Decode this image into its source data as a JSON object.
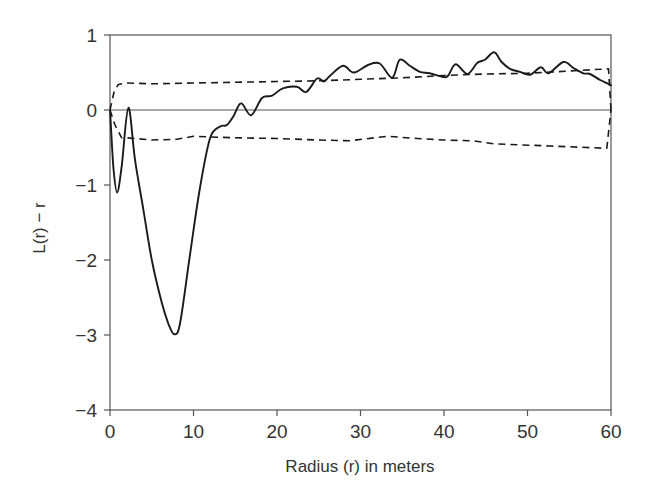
{
  "chart_data": {
    "type": "line",
    "title": "",
    "xlabel": "Radius (r) in meters",
    "ylabel": "L(r) − r",
    "xlim": [
      0,
      60
    ],
    "ylim": [
      -4,
      1
    ],
    "xticks": [
      0,
      10,
      20,
      30,
      40,
      50,
      60
    ],
    "yticks": [
      1,
      0,
      -1,
      -2,
      -3,
      -4
    ],
    "xtick_labels": [
      "0",
      "10",
      "20",
      "30",
      "40",
      "50",
      "60"
    ],
    "ytick_labels": [
      "1",
      "0",
      "−1",
      "−2",
      "−3",
      "−4"
    ],
    "grid": false,
    "legend": null,
    "reference_line": {
      "y": 0
    },
    "series": [
      {
        "name": "L(r) - r (observed)",
        "style": "solid",
        "color": "#1a1a1a",
        "x": [
          0,
          0.4,
          0.85,
          1.4,
          2.2,
          3.0,
          4.0,
          5.0,
          6.2,
          7.0,
          7.7,
          8.4,
          9.6,
          10.8,
          12.0,
          13.2,
          14.0,
          14.8,
          15.7,
          16.9,
          18.2,
          19.4,
          20.7,
          22.4,
          23.5,
          24.8,
          25.6,
          26.3,
          27.9,
          29.2,
          30.9,
          32.3,
          33.8,
          34.7,
          35.9,
          37.1,
          38.3,
          39.9,
          40.5,
          41.4,
          42.8,
          44.0,
          44.9,
          46.0,
          46.9,
          47.9,
          49.1,
          50.3,
          51.6,
          52.5,
          54.3,
          55.5,
          56.7,
          57.5,
          58.7,
          59.7,
          60
        ],
        "y": [
          0,
          -0.75,
          -1.1,
          -0.75,
          0.03,
          -0.67,
          -1.33,
          -2.0,
          -2.57,
          -2.85,
          -2.99,
          -2.84,
          -1.91,
          -1.02,
          -0.37,
          -0.22,
          -0.2,
          -0.08,
          0.09,
          -0.07,
          0.16,
          0.19,
          0.29,
          0.31,
          0.24,
          0.42,
          0.38,
          0.45,
          0.59,
          0.5,
          0.6,
          0.62,
          0.43,
          0.67,
          0.59,
          0.51,
          0.49,
          0.44,
          0.46,
          0.61,
          0.48,
          0.63,
          0.67,
          0.77,
          0.64,
          0.55,
          0.51,
          0.47,
          0.57,
          0.49,
          0.64,
          0.56,
          0.49,
          0.48,
          0.4,
          0.35,
          0.33
        ]
      },
      {
        "name": "Upper envelope",
        "style": "dashed",
        "color": "#1a1a1a",
        "x": [
          0,
          0.5,
          1.0,
          2.0,
          5.0,
          10.0,
          15.0,
          20.0,
          25.0,
          30.0,
          35.0,
          40.0,
          45.0,
          50.0,
          55.0,
          59.7,
          60
        ],
        "y": [
          0,
          0.25,
          0.34,
          0.36,
          0.35,
          0.36,
          0.37,
          0.38,
          0.39,
          0.41,
          0.43,
          0.46,
          0.48,
          0.49,
          0.52,
          0.55,
          0
        ]
      },
      {
        "name": "Lower envelope",
        "style": "dashed",
        "color": "#1a1a1a",
        "x": [
          0,
          0.6,
          1.4,
          2.0,
          5.0,
          8.0,
          10.0,
          15.0,
          20.0,
          25.0,
          28.7,
          33.2,
          36.8,
          40.0,
          43.5,
          45.9,
          52.7,
          59.5,
          60
        ],
        "y": [
          0,
          -0.2,
          -0.37,
          -0.37,
          -0.4,
          -0.39,
          -0.35,
          -0.37,
          -0.38,
          -0.4,
          -0.41,
          -0.35,
          -0.38,
          -0.4,
          -0.41,
          -0.45,
          -0.48,
          -0.51,
          0
        ]
      }
    ]
  }
}
